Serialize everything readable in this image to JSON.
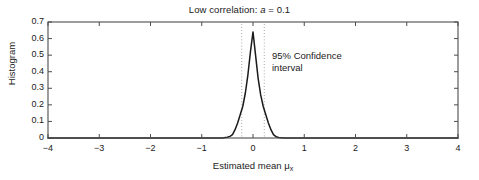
{
  "chart_data": {
    "type": "line",
    "title_prefix": "Low correlation: ",
    "title_var": "a",
    "title_suffix": " = 0.1",
    "title": "Low correlation: a = 0.1",
    "xlabel_text": "Estimated mean ",
    "xlabel_mu": "μ",
    "xlabel_sub": "x",
    "xlabel": "Estimated mean μ_x",
    "ylabel": "Histogram",
    "xlim": [
      -4,
      4
    ],
    "ylim": [
      0,
      0.7
    ],
    "grid": false,
    "legend": null,
    "xticks": [
      -4,
      -3,
      -2,
      -1,
      0,
      1,
      2,
      3,
      4
    ],
    "xtick_labels": [
      "−4",
      "−3",
      "−2",
      "−1",
      "0",
      "1",
      "2",
      "3",
      "4"
    ],
    "yticks": [
      0,
      0.1,
      0.2,
      0.3,
      0.4,
      0.5,
      0.6,
      0.7
    ],
    "ytick_labels": [
      "0",
      "0.1",
      "0.2",
      "0.3",
      "0.4",
      "0.5",
      "0.6",
      "0.7"
    ],
    "line_color": "#1a1a1a",
    "axis_color": "#4d4d4d",
    "ci_line_color": "#808080",
    "series": [
      {
        "name": "Histogram of estimated mean",
        "x": [
          -4.0,
          -3.5,
          -3.0,
          -2.5,
          -2.0,
          -1.5,
          -1.0,
          -0.8,
          -0.6,
          -0.5,
          -0.45,
          -0.4,
          -0.35,
          -0.3,
          -0.25,
          -0.2,
          -0.15,
          -0.1,
          -0.05,
          0.0,
          0.05,
          0.1,
          0.15,
          0.2,
          0.25,
          0.3,
          0.35,
          0.4,
          0.45,
          0.5,
          0.6,
          0.8,
          1.0,
          1.5,
          2.0,
          2.5,
          3.0,
          3.5,
          4.0
        ],
        "y": [
          0.0,
          0.0,
          0.0,
          0.0,
          0.0,
          0.0,
          0.0,
          0.0,
          0.0,
          0.005,
          0.01,
          0.02,
          0.05,
          0.09,
          0.14,
          0.19,
          0.27,
          0.38,
          0.52,
          0.64,
          0.5,
          0.36,
          0.26,
          0.19,
          0.14,
          0.09,
          0.05,
          0.02,
          0.008,
          0.003,
          0.0,
          0.0,
          0.0,
          0.0,
          0.0,
          0.0,
          0.0,
          0.0,
          0.0
        ]
      }
    ],
    "annotations": [
      {
        "name": "confidence-interval",
        "line1": "95% Confidence",
        "line2": "interval",
        "ci_lower": -0.22,
        "ci_upper": 0.22,
        "level": "95%"
      }
    ],
    "peak": {
      "x": 0.0,
      "y": 0.64
    }
  }
}
